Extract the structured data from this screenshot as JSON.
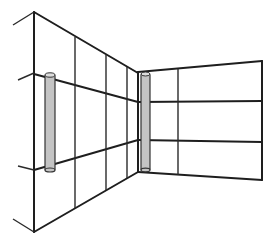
{
  "diagram": {
    "title": "",
    "colors": {
      "line": "#1e1e1e",
      "cylinder_fill": "#c4c4c4",
      "cylinder_top": "#dcdcdc",
      "background": "#ffffff"
    },
    "elements": {
      "left_wall": {
        "vertical_lines": 5,
        "horizontal_rails": 2
      },
      "right_wall": {
        "vertical_lines": 3,
        "horizontal_rails": 2
      },
      "posts": [
        {
          "name": "left-post"
        },
        {
          "name": "corner-post"
        }
      ]
    }
  }
}
